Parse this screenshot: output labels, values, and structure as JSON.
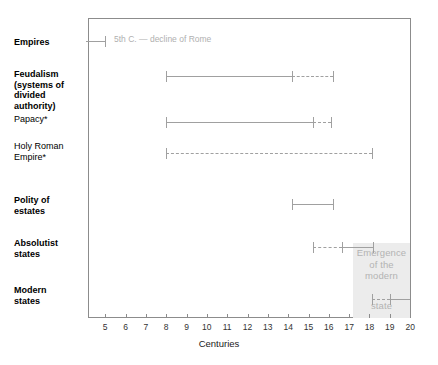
{
  "chart_data": {
    "type": "table",
    "title": "",
    "subtitle": "",
    "xlabel": "Centuries",
    "ylabel": "",
    "xlim": [
      4.05,
      20.0
    ],
    "grid": false,
    "legend_position": "none",
    "x_ticks": [
      5,
      6,
      7,
      8,
      9,
      10,
      11,
      12,
      13,
      14,
      15,
      16,
      17,
      18,
      19,
      20
    ],
    "x_tick_labels": [
      "5",
      "6",
      "7",
      "8",
      "9",
      "10",
      "11",
      "12",
      "13",
      "14",
      "15",
      "16",
      "17",
      "18",
      "19",
      "20"
    ],
    "categories": [
      "Empires",
      "Feudalism (systems of divided authority)",
      "Papacy*",
      "Holy Roman Empire*",
      "Polity of estates",
      "Absolutist states",
      "Modern states"
    ],
    "series": [
      {
        "name": "Empires",
        "segments": [
          {
            "start": 4.05,
            "end": 5.0,
            "style": "solid"
          }
        ],
        "caps": [
          5.0
        ],
        "annotation": "5th C. — decline of Rome"
      },
      {
        "name": "Feudalism (systems of divided authority)",
        "segments": [
          {
            "start": 8.0,
            "end": 14.2,
            "style": "solid"
          },
          {
            "start": 14.2,
            "end": 16.2,
            "style": "dashed"
          }
        ],
        "caps": [
          8.0,
          14.2,
          16.2
        ]
      },
      {
        "name": "Papacy*",
        "segments": [
          {
            "start": 8.0,
            "end": 15.2,
            "style": "solid"
          },
          {
            "start": 15.2,
            "end": 16.1,
            "style": "dashed"
          }
        ],
        "caps": [
          8.0,
          15.2,
          16.1
        ]
      },
      {
        "name": "Holy Roman Empire*",
        "segments": [
          {
            "start": 8.0,
            "end": 18.1,
            "style": "dashed"
          }
        ],
        "caps": [
          8.0,
          18.1
        ]
      },
      {
        "name": "Polity of estates",
        "segments": [
          {
            "start": 14.2,
            "end": 16.2,
            "style": "solid"
          }
        ],
        "caps": [
          14.2,
          16.2
        ]
      },
      {
        "name": "Absolutist states",
        "segments": [
          {
            "start": 15.2,
            "end": 16.65,
            "style": "dashed"
          },
          {
            "start": 16.65,
            "end": 18.15,
            "style": "solid"
          }
        ],
        "caps": [
          15.2,
          16.65,
          18.15
        ]
      },
      {
        "name": "Modern states",
        "segments": [
          {
            "start": 18.1,
            "end": 19.0,
            "style": "dashed"
          },
          {
            "start": 19.0,
            "end": 20.0,
            "style": "solid"
          }
        ],
        "caps": [
          18.1,
          19.0
        ]
      }
    ],
    "annotations": [
      {
        "text": "5th C. — decline of Rome",
        "x": 5.2,
        "row": 0
      },
      {
        "text": "Emergence of the modern state",
        "x_range": [
          17.0,
          20.0
        ],
        "row": 5
      }
    ]
  },
  "rows": [
    {
      "id": "empires",
      "label": "Empires",
      "weight": "bold"
    },
    {
      "id": "feudalism",
      "label": "Feudalism\n(systems of\ndivided\nauthority)",
      "weight": "bold"
    },
    {
      "id": "papacy",
      "label": "Papacy*",
      "weight": "normal"
    },
    {
      "id": "holy-roman-empire",
      "label": "Holy Roman\nEmpire*",
      "weight": "normal"
    },
    {
      "id": "polity-of-estates",
      "label": "Polity of\nestates",
      "weight": "bold"
    },
    {
      "id": "absolutist-states",
      "label": "Absolutist\nstates",
      "weight": "bold"
    },
    {
      "id": "modern-states",
      "label": "Modern\nstates",
      "weight": "bold"
    }
  ],
  "labels": {
    "empires": "Empires",
    "feudalism_l1": "Feudalism",
    "feudalism_l2": "(systems of",
    "feudalism_l3": "divided",
    "feudalism_l4": "authority)",
    "papacy": "Papacy*",
    "hre_l1": "Holy Roman",
    "hre_l2": "Empire*",
    "polity_l1": "Polity of",
    "polity_l2": "estates",
    "absolutist_l1": "Absolutist",
    "absolutist_l2": "states",
    "modern_l1": "Modern",
    "modern_l2": "states"
  },
  "annotations": {
    "decline_of_rome": "5th C. — decline of Rome",
    "emergence_l1": "Emergence",
    "emergence_l2": "of the",
    "emergence_l3": "modern",
    "emergence_l4": "state"
  },
  "axis": {
    "title": "Centuries",
    "ticks": [
      "5",
      "6",
      "7",
      "8",
      "9",
      "10",
      "11",
      "12",
      "13",
      "14",
      "15",
      "16",
      "17",
      "18",
      "19",
      "20"
    ]
  },
  "colors": {
    "line": "#a0a0a0",
    "frame": "#8c8c8c",
    "highlight": "#ececec",
    "muted_text": "#b3b3b3",
    "text": "#000000"
  }
}
